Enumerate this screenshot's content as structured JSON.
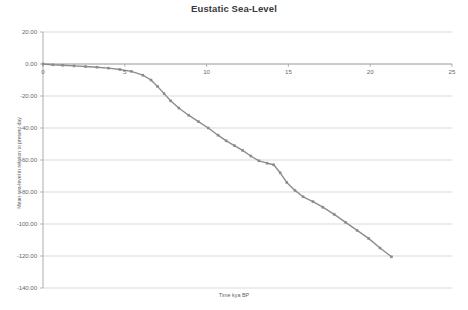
{
  "chart_data": {
    "type": "line",
    "title": "Eustatic Sea-Level",
    "xlabel": "Time kya BP",
    "ylabel": "Mean sea-level in relation to present day",
    "xlim": [
      0,
      25
    ],
    "ylim": [
      -140,
      20
    ],
    "xticks": [
      "0",
      "5",
      "10",
      "15",
      "20",
      "25"
    ],
    "xtick_values": [
      0,
      5,
      10,
      15,
      20,
      25
    ],
    "yticks": [
      "20.00",
      "0.00",
      "-20.00",
      "-40.00",
      "-60.00",
      "-80.00",
      "-100.00",
      "-120.00",
      "-140.00"
    ],
    "ytick_values": [
      20,
      0,
      -20,
      -40,
      -60,
      -80,
      -100,
      -120,
      -140
    ],
    "grid": "horizontal",
    "legend": "none",
    "series": [
      {
        "name": "Eustatic sea-level",
        "color": "#8c8c8c",
        "marker": "square",
        "x": [
          0,
          0.6,
          1.2,
          1.9,
          2.6,
          3.3,
          4.0,
          4.7,
          5.4,
          6.1,
          6.6,
          7.0,
          7.4,
          7.8,
          8.3,
          8.9,
          9.5,
          10.1,
          10.7,
          11.2,
          11.7,
          12.2,
          12.7,
          13.2,
          13.7,
          14.1,
          14.5,
          14.9,
          15.4,
          15.9,
          16.5,
          17.1,
          17.8,
          18.5,
          19.2,
          19.9,
          20.6,
          21.3
        ],
        "y": [
          0.0,
          -0.5,
          -0.8,
          -1.2,
          -1.6,
          -2.0,
          -2.6,
          -3.4,
          -4.6,
          -7.0,
          -10.0,
          -14.0,
          -18.5,
          -23.0,
          -27.5,
          -32.0,
          -36.0,
          -40.0,
          -44.5,
          -48.0,
          -51.0,
          -54.0,
          -57.5,
          -60.5,
          -62.0,
          -63.0,
          -68.0,
          -74.0,
          -79.0,
          -83.0,
          -86.0,
          -89.5,
          -94.0,
          -99.0,
          -104.0,
          -109.0,
          -115.0,
          -120.5
        ]
      }
    ]
  }
}
